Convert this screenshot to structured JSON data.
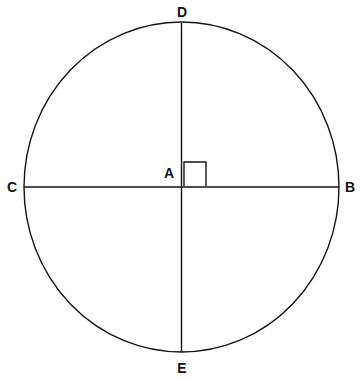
{
  "figure": {
    "name": "circle-with-perpendicular-diameters",
    "background_color": "#ffffff",
    "stroke_color": "#141414",
    "label_color": "#141414",
    "stroke_width": 1.4,
    "width": 360,
    "height": 378
  },
  "circle": {
    "name": "main-circle",
    "center_x": 181.5,
    "center_y": 187,
    "radius_x": 157.5,
    "radius_y": 165
  },
  "center_point": {
    "id": "A",
    "label": "A",
    "x": 181.5,
    "y": 187,
    "label_x": 169,
    "label_y": 173
  },
  "points": [
    {
      "id": "D",
      "label": "D",
      "x": 181.5,
      "y": 22,
      "label_x": 182,
      "label_y": 12,
      "position": "top"
    },
    {
      "id": "C",
      "label": "C",
      "x": 24,
      "y": 187,
      "label_x": 12,
      "label_y": 187,
      "position": "left"
    },
    {
      "id": "B",
      "label": "B",
      "x": 339,
      "y": 187,
      "label_x": 350,
      "label_y": 187,
      "position": "right"
    },
    {
      "id": "E",
      "label": "E",
      "x": 181.5,
      "y": 352,
      "label_x": 182,
      "label_y": 368,
      "position": "bottom"
    }
  ],
  "chords": [
    {
      "name": "diameter-cb",
      "x1": 24,
      "y1": 187,
      "x2": 339,
      "y2": 187,
      "endpoints": "C-B",
      "orientation": "horizontal"
    },
    {
      "name": "diameter-de",
      "x1": 181.5,
      "y1": 23,
      "x2": 181.5,
      "y2": 352,
      "endpoints": "D-E",
      "orientation": "vertical"
    }
  ],
  "right_angle_marker": {
    "name": "right-angle-marker-DAB",
    "angle": "DAB",
    "quadrant": "upper-right",
    "x": 184,
    "y": 162,
    "size_x": 22,
    "size_y": 24,
    "degrees": "90"
  }
}
